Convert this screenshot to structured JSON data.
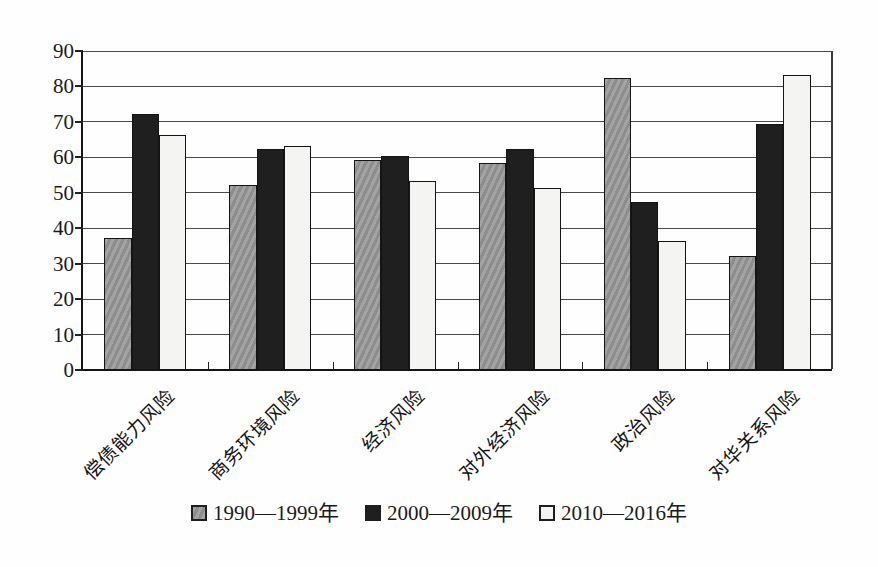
{
  "figure": {
    "background_color": "#fefefe",
    "axis_color": "#151515",
    "gridline_color": "#4a4a4a"
  },
  "chart_data": {
    "type": "bar",
    "title": "",
    "xlabel": "",
    "ylabel": "",
    "ylim": [
      0,
      90
    ],
    "ytick_interval": 10,
    "yticks": [
      "0",
      "10",
      "20",
      "30",
      "40",
      "50",
      "60",
      "70",
      "80",
      "90"
    ],
    "grid": "horizontal",
    "legend_position": "bottom",
    "categories": [
      "偿债能力风险",
      "商务环境风险",
      "经济风险",
      "对外经济风险",
      "政治风险",
      "对华关系风险"
    ],
    "series": [
      {
        "name": "1990—1999年",
        "pattern": "hatch",
        "color": "#989898",
        "values": [
          37,
          52,
          59,
          58,
          82,
          32
        ]
      },
      {
        "name": "2000—2009年",
        "pattern": "solid",
        "color": "#1f1f1f",
        "values": [
          72,
          62,
          60,
          62,
          47,
          69
        ]
      },
      {
        "name": "2010—2016年",
        "pattern": "solid",
        "color": "#f4f4f2",
        "values": [
          66,
          63,
          53,
          51,
          36,
          83
        ]
      }
    ]
  }
}
